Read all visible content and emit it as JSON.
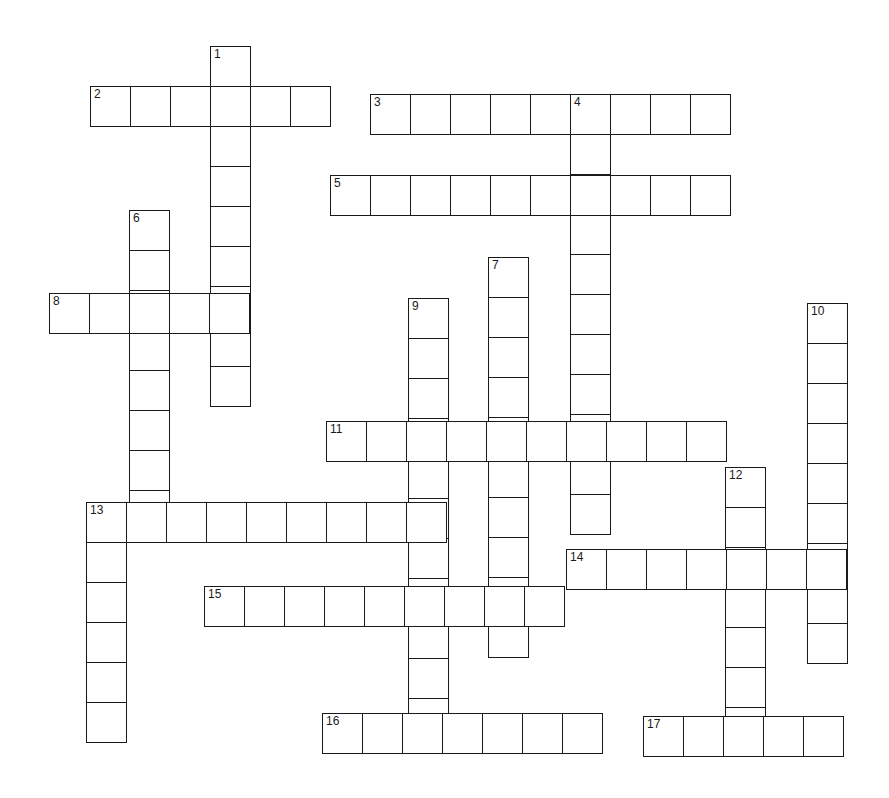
{
  "puzzle": {
    "cell_size": 41,
    "line_color": "#1a1a1a",
    "background": "#ffffff",
    "entries": [
      {
        "number": "1",
        "direction": "down",
        "x": 210,
        "y": 46,
        "length": 9
      },
      {
        "number": "2",
        "direction": "across",
        "x": 90,
        "y": 86,
        "length": 6
      },
      {
        "number": "3",
        "direction": "across",
        "x": 370,
        "y": 94,
        "length": 9
      },
      {
        "number": "4",
        "direction": "down",
        "x": 570,
        "y": 94,
        "length": 11
      },
      {
        "number": "5",
        "direction": "across",
        "x": 330,
        "y": 175,
        "length": 10
      },
      {
        "number": "6",
        "direction": "down",
        "x": 129,
        "y": 210,
        "length": 8
      },
      {
        "number": "7",
        "direction": "down",
        "x": 488,
        "y": 257,
        "length": 10
      },
      {
        "number": "8",
        "direction": "across",
        "x": 49,
        "y": 293,
        "length": 5
      },
      {
        "number": "9",
        "direction": "down",
        "x": 408,
        "y": 298,
        "length": 11
      },
      {
        "number": "10",
        "direction": "down",
        "x": 807,
        "y": 303,
        "length": 9
      },
      {
        "number": "11",
        "direction": "across",
        "x": 326,
        "y": 421,
        "length": 10
      },
      {
        "number": "12",
        "direction": "down",
        "x": 725,
        "y": 467,
        "length": 7
      },
      {
        "number": "13",
        "direction": "across",
        "x": 86,
        "y": 502,
        "length": 9
      },
      {
        "number": "13",
        "direction": "down",
        "x": 86,
        "y": 502,
        "length": 6,
        "unnumbered": true
      },
      {
        "number": "14",
        "direction": "across",
        "x": 566,
        "y": 549,
        "length": 7
      },
      {
        "number": "15",
        "direction": "across",
        "x": 204,
        "y": 586,
        "length": 9
      },
      {
        "number": "16",
        "direction": "across",
        "x": 322,
        "y": 713,
        "length": 7
      },
      {
        "number": "17",
        "direction": "across",
        "x": 643,
        "y": 716,
        "length": 5
      }
    ]
  }
}
